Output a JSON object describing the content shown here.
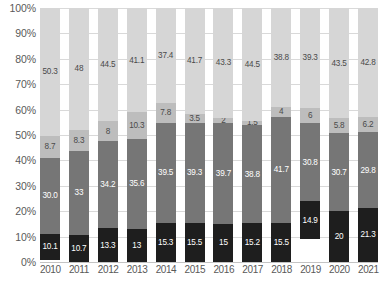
{
  "chart_data": {
    "type": "bar",
    "title": "",
    "xlabel": "",
    "ylabel": "",
    "stacked": true,
    "grid": true,
    "legend": "none",
    "ylim": [
      0,
      100
    ],
    "y_ticks": [
      "0%",
      "10%",
      "20%",
      "30%",
      "40%",
      "50%",
      "60%",
      "70%",
      "80%",
      "90%",
      "100%"
    ],
    "categories": [
      "2010",
      "2011",
      "2012",
      "2013",
      "2014",
      "2015",
      "2016",
      "2017",
      "2018",
      "2019",
      "2020",
      "2021"
    ],
    "series": [
      {
        "name": "segment-4-top",
        "color": "#d6d6d6",
        "values": [
          50.3,
          48,
          44.5,
          41.1,
          37.4,
          41.7,
          43.3,
          44.5,
          38.8,
          39.3,
          43.5,
          42.8
        ],
        "labels": [
          "50.3",
          "48",
          "44.5",
          "41.1",
          "37.4",
          "41.7",
          "43.3",
          "44.5",
          "38.8",
          "39.3",
          "43.5",
          "42.8"
        ]
      },
      {
        "name": "segment-3",
        "color": "#bdbdbd",
        "values": [
          8.7,
          8.3,
          8,
          10.3,
          7.8,
          3.5,
          2,
          1.5,
          4,
          6,
          5.8,
          6.2
        ],
        "labels": [
          "8.7",
          "8.3",
          "8",
          "10.3",
          "7.8",
          "3.5",
          "2",
          "1.5",
          "4",
          "6",
          "5.8",
          "6.2"
        ]
      },
      {
        "name": "segment-2",
        "color": "#767676",
        "values": [
          30.0,
          33,
          34.2,
          35.6,
          39.5,
          39.3,
          39.7,
          38.8,
          41.7,
          30.8,
          30.7,
          29.8
        ],
        "labels": [
          "30.0",
          "33",
          "34.2",
          "35.6",
          "39.5",
          "39.3",
          "39.7",
          "38.8",
          "41.7",
          "30.8",
          "30.7",
          "29.8"
        ]
      },
      {
        "name": "segment-1-bottom",
        "color": "#1e1e1e",
        "values": [
          10.1,
          10.7,
          13.3,
          13,
          15.3,
          15.5,
          15,
          15.2,
          15.5,
          14.9,
          20,
          21.3
        ],
        "labels": [
          "10.1",
          "10.7",
          "13.3",
          "13",
          "15.3",
          "15.5",
          "15",
          "15.2",
          "15.5",
          "14.9",
          "20",
          "21.3"
        ]
      }
    ]
  }
}
